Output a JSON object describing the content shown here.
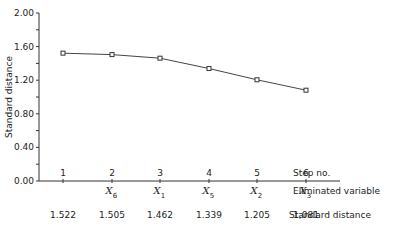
{
  "chart_data": {
    "type": "line",
    "title": "",
    "xlabel": "Step no.",
    "ylabel": "Standard distance",
    "ylim": [
      0.0,
      2.0
    ],
    "yticks": [
      "0.00",
      "0.40",
      "0.80",
      "1.20",
      "1.60",
      "2.00"
    ],
    "grid": false,
    "categories": [
      "1",
      "2",
      "3",
      "4",
      "5",
      "6"
    ],
    "series": [
      {
        "name": "Standard distance",
        "values": [
          1.522,
          1.505,
          1.462,
          1.339,
          1.205,
          1.081
        ],
        "marker": "square"
      }
    ],
    "eliminated_variable": [
      "",
      "X6",
      "X1",
      "X5",
      "X2",
      "X3"
    ],
    "row_labels": {
      "step": "Step no.",
      "eliminated": "Eliminated variable",
      "distance": "Standard distance"
    },
    "distance_labels": [
      "1.522",
      "1.505",
      "1.462",
      "1.339",
      "1.205",
      "1,081"
    ]
  },
  "axis": {
    "y_label": "Standard distance",
    "y_ticks": [
      "0.00",
      "0.40",
      "0.80",
      "1.20",
      "1.60",
      "2.00"
    ]
  },
  "steps": [
    "1",
    "2",
    "3",
    "4",
    "5",
    "6"
  ],
  "eliminated": [
    {
      "base": "",
      "sub": ""
    },
    {
      "base": "X",
      "sub": "6"
    },
    {
      "base": "X",
      "sub": "1"
    },
    {
      "base": "X",
      "sub": "5"
    },
    {
      "base": "X",
      "sub": "2"
    },
    {
      "base": "X",
      "sub": "3"
    }
  ],
  "distances": [
    "1.522",
    "1.505",
    "1.462",
    "1.339",
    "1.205",
    "1,081"
  ],
  "labels": {
    "step": "Step no.",
    "eliminated": "Eliminated variable",
    "distance": "Standard distance"
  }
}
